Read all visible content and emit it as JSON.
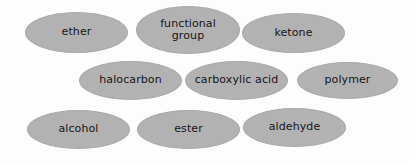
{
  "canvas": {
    "width": 415,
    "height": 165,
    "background_color": "#fdfdfd"
  },
  "style": {
    "bubble_fill": "#b2b2b2",
    "bubble_border": "#a8a8a8",
    "text_color": "#161616"
  },
  "word_bank": {
    "title": "",
    "items": [
      {
        "label": "ether",
        "x": 25,
        "y": 12,
        "w": 103,
        "h": 41,
        "font_size": 11
      },
      {
        "label": "functional\ngroup",
        "x": 136,
        "y": 6,
        "w": 104,
        "h": 48,
        "font_size": 11
      },
      {
        "label": "ketone",
        "x": 242,
        "y": 13,
        "w": 103,
        "h": 40,
        "font_size": 11
      },
      {
        "label": "halocarbon",
        "x": 79,
        "y": 61,
        "w": 103,
        "h": 39,
        "font_size": 11
      },
      {
        "label": "carboxylic acid",
        "x": 185,
        "y": 61,
        "w": 103,
        "h": 39,
        "font_size": 11
      },
      {
        "label": "polymer",
        "x": 297,
        "y": 62,
        "w": 101,
        "h": 37,
        "font_size": 11
      },
      {
        "label": "alcohol",
        "x": 27,
        "y": 110,
        "w": 103,
        "h": 39,
        "font_size": 11
      },
      {
        "label": "ester",
        "x": 137,
        "y": 110,
        "w": 103,
        "h": 39,
        "font_size": 11
      },
      {
        "label": "aldehyde",
        "x": 243,
        "y": 108,
        "w": 103,
        "h": 39,
        "font_size": 11
      }
    ]
  }
}
